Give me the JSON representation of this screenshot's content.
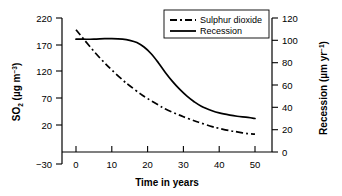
{
  "chart_data": {
    "type": "line",
    "title": "",
    "xlabel": "Time in years",
    "ylabel_left": "SO2 (µg m-3)",
    "ylabel_right": "Recession (µm yr-1)",
    "grid": false,
    "legend_position": "top-right",
    "xlim": [
      -3,
      53
    ],
    "xticks": [
      "0",
      "10",
      "20",
      "30",
      "40",
      "50"
    ],
    "xtick_values": [
      0,
      10,
      20,
      30,
      40,
      50
    ],
    "left_axis": {
      "label_main": "SO",
      "label_sub": "2",
      "label_unit_open": " (µg m",
      "label_unit_sup": "−3",
      "label_unit_close": ")",
      "ticks": [
        "220",
        "170",
        "120",
        "70",
        "20",
        "−30"
      ],
      "tick_values": [
        220,
        170,
        120,
        70,
        20,
        -30
      ],
      "ylim": [
        -30,
        220
      ]
    },
    "right_axis": {
      "label_main": "Recession (µm yr",
      "label_sup": "−1",
      "label_close": ")",
      "ticks": [
        "120",
        "100",
        "80",
        "60",
        "40",
        "20",
        "0"
      ],
      "tick_values": [
        120,
        100,
        80,
        60,
        40,
        20,
        0
      ],
      "ylim": [
        0,
        120
      ]
    },
    "series": [
      {
        "name": "Sulphur dioxide",
        "axis": "left",
        "style": "dash-dot",
        "color": "#000000",
        "x": [
          0,
          2,
          5,
          8,
          10,
          13,
          15,
          18,
          20,
          23,
          25,
          28,
          30,
          33,
          35,
          38,
          40,
          43,
          45,
          48,
          50
        ],
        "y": [
          200,
          185,
          163,
          143,
          131,
          114,
          104,
          90,
          82,
          71,
          64,
          56,
          51,
          44,
          40,
          34,
          31,
          27,
          25,
          22,
          21
        ]
      },
      {
        "name": "Recession",
        "axis": "right",
        "style": "solid",
        "color": "#000000",
        "x": [
          0,
          2,
          5,
          8,
          10,
          13,
          15,
          17,
          19,
          21,
          23,
          25,
          27,
          29,
          31,
          33,
          35,
          38,
          40,
          43,
          45,
          48,
          50
        ],
        "y": [
          101,
          101,
          101,
          101.5,
          101.5,
          101,
          100,
          98,
          94,
          88,
          80,
          71,
          63,
          56,
          50,
          45,
          41,
          37,
          35,
          33,
          32,
          31,
          30
        ]
      }
    ]
  },
  "legend": {
    "items": [
      {
        "label": "Sulphur dioxide",
        "style": "dash-dot"
      },
      {
        "label": "Recession",
        "style": "solid"
      }
    ]
  }
}
